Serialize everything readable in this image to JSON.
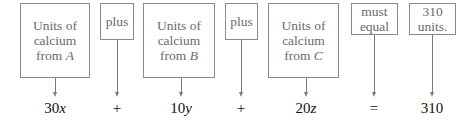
{
  "boxes": [
    {
      "line1": "Units of",
      "line2": "calcium",
      "line3_prefix": "from ",
      "line3_var": "A"
    },
    {
      "label": "plus"
    },
    {
      "line1": "Units of",
      "line2": "calcium",
      "line3_prefix": "from ",
      "line3_var": "B"
    },
    {
      "label": "plus"
    },
    {
      "line1": "Units of",
      "line2": "calcium",
      "line3_prefix": "from ",
      "line3_var": "C"
    },
    {
      "line1": "must",
      "line2": "equal"
    },
    {
      "line1": "310",
      "line2": "units."
    }
  ],
  "equation": [
    {
      "coef": "30",
      "var": "x"
    },
    {
      "symbol": "+"
    },
    {
      "coef": "10",
      "var": "y"
    },
    {
      "symbol": "+"
    },
    {
      "coef": "20",
      "var": "z"
    },
    {
      "symbol": "="
    },
    {
      "coef": "310",
      "var": ""
    }
  ],
  "colors": {
    "box_border": "#8a8a8a",
    "box_text": "#6a6a6a",
    "equation_text": "#111111"
  }
}
